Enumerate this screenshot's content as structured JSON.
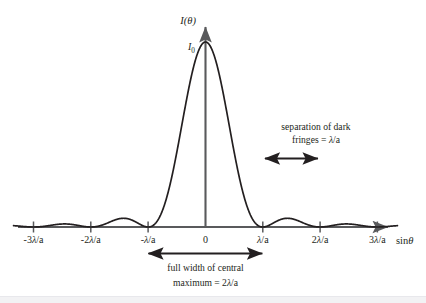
{
  "figure": {
    "background_color": "#ffffff",
    "ink_color": "#231f20",
    "axis_color": "#595a5c"
  },
  "axes": {
    "y_axis_label": "I(θ)",
    "x_axis_label": "sinθ",
    "peak_value_label": "I",
    "peak_value_subscript": "0",
    "x_tick_labels": [
      "-3λ/a",
      "-2λ/a",
      "-λ/a",
      "0",
      "λ/a",
      "2λ/a",
      "3λ/a"
    ]
  },
  "annotations": {
    "separation": {
      "line1": "separation of dark",
      "line2": "fringes = λ/a"
    },
    "central_width": {
      "line1": "full width of central",
      "line2": "maximum = 2λ/a"
    }
  },
  "chart_data": {
    "type": "line",
    "xlabel": "sinθ",
    "ylabel": "I(θ)",
    "function": "I(θ) = I0 * (sin(u)/u)^2, u = π a sinθ / λ",
    "x_unit": "λ/a",
    "xlim": [
      -3.35,
      3.35
    ],
    "ylim": [
      0,
      1.0
    ],
    "grid": false,
    "legend": false,
    "x_ticks": [
      -3,
      -2,
      -1,
      0,
      1,
      2,
      3
    ],
    "x_tick_labels": [
      "-3λ/a",
      "-2λ/a",
      "-λ/a",
      "0",
      "λ/a",
      "2λ/a",
      "3λ/a"
    ],
    "minima_at": [
      -3,
      -2,
      -1,
      1,
      2,
      3
    ],
    "maxima": [
      {
        "x": 0,
        "y": 1.0,
        "label": "I0"
      },
      {
        "x": 1.43,
        "y": 0.0472
      },
      {
        "x": -1.43,
        "y": 0.0472
      },
      {
        "x": 2.46,
        "y": 0.0165
      },
      {
        "x": -2.46,
        "y": 0.0165
      }
    ],
    "measurements": [
      {
        "name": "separation of dark fringes",
        "value": "λ/a",
        "span": [
          1,
          2
        ]
      },
      {
        "name": "full width of central maximum",
        "value": "2λ/a",
        "span": [
          -1,
          1
        ]
      }
    ]
  }
}
